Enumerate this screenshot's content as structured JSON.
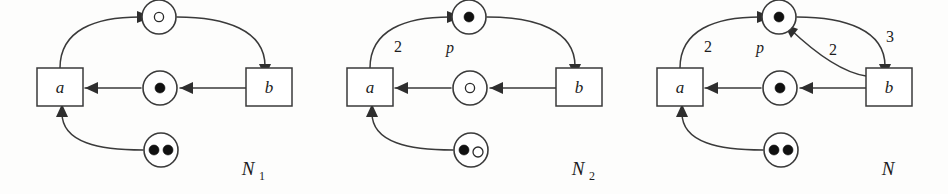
{
  "figure": {
    "kind": "petri-net-diagram",
    "ink_color": "#3a3a3a",
    "background_color": "#fdfdfc",
    "token_color": "#111111",
    "nets": [
      {
        "id": "N1",
        "caption_base": "N",
        "caption_sub": "1",
        "transitions": [
          {
            "id": "a",
            "label": "a"
          },
          {
            "id": "b",
            "label": "b"
          }
        ],
        "places": [
          {
            "id": "p_top",
            "label": "",
            "tokens": [
              "hollow"
            ]
          },
          {
            "id": "p_middle",
            "label": "",
            "tokens": [
              "filled"
            ]
          },
          {
            "id": "p_bottom",
            "label": "",
            "tokens": [
              "filled",
              "filled"
            ]
          }
        ],
        "arcs": [
          {
            "from": "a",
            "to": "p_top",
            "weight": ""
          },
          {
            "from": "p_top",
            "to": "b",
            "weight": ""
          },
          {
            "from": "b",
            "to": "p_middle",
            "weight": ""
          },
          {
            "from": "p_middle",
            "to": "a",
            "weight": ""
          },
          {
            "from": "p_bottom",
            "to": "a",
            "weight": ""
          }
        ]
      },
      {
        "id": "N2",
        "caption_base": "N",
        "caption_sub": "2",
        "transitions": [
          {
            "id": "a",
            "label": "a"
          },
          {
            "id": "b",
            "label": "b"
          }
        ],
        "places": [
          {
            "id": "p_top",
            "label": "p",
            "tokens": [
              "filled"
            ]
          },
          {
            "id": "p_middle",
            "label": "",
            "tokens": [
              "hollow"
            ]
          },
          {
            "id": "p_bottom",
            "label": "",
            "tokens": [
              "filled",
              "hollow"
            ]
          }
        ],
        "arcs": [
          {
            "from": "a",
            "to": "p_top",
            "weight": "2"
          },
          {
            "from": "p_top",
            "to": "b",
            "weight": ""
          },
          {
            "from": "b",
            "to": "p_middle",
            "weight": ""
          },
          {
            "from": "p_middle",
            "to": "a",
            "weight": ""
          },
          {
            "from": "p_bottom",
            "to": "a",
            "weight": ""
          }
        ]
      },
      {
        "id": "N",
        "caption_base": "N",
        "caption_sub": "",
        "transitions": [
          {
            "id": "a",
            "label": "a"
          },
          {
            "id": "b",
            "label": "b"
          }
        ],
        "places": [
          {
            "id": "p_top",
            "label": "p",
            "tokens": [
              "filled"
            ]
          },
          {
            "id": "p_middle",
            "label": "",
            "tokens": [
              "filled"
            ]
          },
          {
            "id": "p_bottom",
            "label": "",
            "tokens": [
              "filled",
              "filled"
            ]
          }
        ],
        "arcs": [
          {
            "from": "a",
            "to": "p_top",
            "weight": "2"
          },
          {
            "from": "p_top",
            "to": "b",
            "weight": "3"
          },
          {
            "from": "b",
            "to": "p_top",
            "weight": "2"
          },
          {
            "from": "b",
            "to": "p_middle",
            "weight": ""
          },
          {
            "from": "p_middle",
            "to": "a",
            "weight": ""
          },
          {
            "from": "p_bottom",
            "to": "a",
            "weight": ""
          }
        ]
      }
    ]
  }
}
